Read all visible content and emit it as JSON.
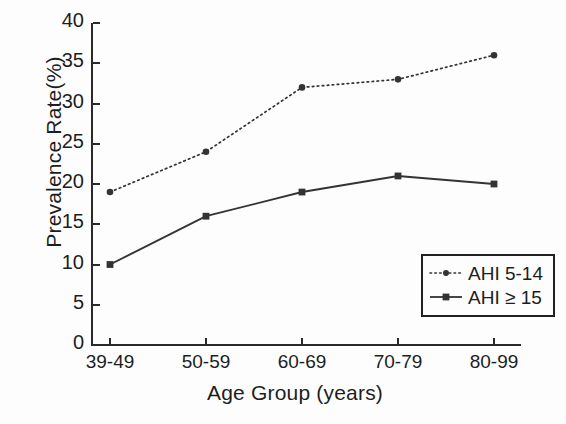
{
  "chart_data": {
    "type": "line",
    "title": "",
    "xlabel": "Age Group (years)",
    "ylabel": "Prevalence Rate(%)",
    "categories": [
      "39-49",
      "50-59",
      "60-69",
      "70-79",
      "80-99"
    ],
    "ylim": [
      0,
      40
    ],
    "ytick_labels": [
      "0",
      "5",
      "10",
      "15",
      "20",
      "25",
      "30",
      "35",
      "40"
    ],
    "ytick_values": [
      0,
      5,
      10,
      15,
      20,
      25,
      30,
      35,
      40
    ],
    "grid": false,
    "legend_position": "bottom-right",
    "series": [
      {
        "name": "AHI 5-14",
        "values": [
          19,
          24,
          32,
          33,
          36
        ],
        "line_style": "dotted",
        "marker": "circle",
        "color": "#333333"
      },
      {
        "name": "AHI ≥ 15",
        "values": [
          10,
          16,
          19,
          21,
          20
        ],
        "line_style": "solid",
        "marker": "square",
        "color": "#333333"
      }
    ]
  },
  "legend": {
    "items": [
      {
        "label": "AHI 5-14"
      },
      {
        "label": "AHI ≥ 15"
      }
    ]
  },
  "colors": {
    "axis": "#2a2a2a",
    "text": "#1d1d1d",
    "background": "#fdfdfd",
    "series": "#333333"
  }
}
